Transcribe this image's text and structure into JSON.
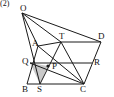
{
  "figure": {
    "problem_number": "(2)",
    "background_color": "#ffffff",
    "stroke_color": "#1a1a1a",
    "shade_color": "#c9c9c9",
    "width": 114,
    "height": 97,
    "points": {
      "O": {
        "label": "O",
        "x": 22,
        "y": 13,
        "label_x": 20,
        "label_y": 4
      },
      "A": {
        "label": "A",
        "x": 38,
        "y": 46,
        "label_x": 32,
        "label_y": 39
      },
      "T": {
        "label": "T",
        "x": 61,
        "y": 42,
        "label_x": 59,
        "label_y": 32
      },
      "D": {
        "label": "D",
        "x": 101,
        "y": 42,
        "label_x": 98,
        "label_y": 32
      },
      "Q": {
        "label": "Q",
        "x": 30,
        "y": 63,
        "label_x": 22,
        "label_y": 57
      },
      "P": {
        "label": "P",
        "x": 48,
        "y": 66,
        "label_x": 52,
        "label_y": 62
      },
      "R": {
        "label": "R",
        "x": 92,
        "y": 63,
        "label_x": 94,
        "label_y": 58
      },
      "B": {
        "label": "B",
        "x": 27,
        "y": 84,
        "label_x": 22,
        "label_y": 85
      },
      "S": {
        "label": "S",
        "x": 40,
        "y": 84,
        "label_x": 37,
        "label_y": 85
      },
      "C": {
        "label": "C",
        "x": 84,
        "y": 84,
        "label_x": 80,
        "label_y": 85
      }
    },
    "segments": [
      {
        "name": "segment-O-A",
        "from": "O",
        "to": "A"
      },
      {
        "name": "segment-O-T",
        "from": "O",
        "to": "T"
      },
      {
        "name": "segment-O-D",
        "from": "O",
        "to": "D"
      },
      {
        "name": "segment-O-S",
        "from": "O",
        "to": "S"
      },
      {
        "name": "segment-A-T",
        "from": "A",
        "to": "T"
      },
      {
        "name": "segment-T-D",
        "from": "T",
        "to": "D"
      },
      {
        "name": "segment-A-B",
        "from": "A",
        "to": "B"
      },
      {
        "name": "segment-D-C",
        "from": "D",
        "to": "C"
      },
      {
        "name": "segment-B-S",
        "from": "B",
        "to": "S"
      },
      {
        "name": "segment-S-C",
        "from": "S",
        "to": "C"
      },
      {
        "name": "segment-Q-R",
        "from": "Q",
        "to": "R"
      },
      {
        "name": "segment-A-C",
        "from": "A",
        "to": "C"
      },
      {
        "name": "segment-T-S",
        "from": "T",
        "to": "S"
      },
      {
        "name": "segment-T-C",
        "from": "T",
        "to": "C"
      },
      {
        "name": "segment-Q-C",
        "from": "Q",
        "to": "C"
      }
    ],
    "shaded_region": {
      "name": "shaded-triangle-QSP",
      "vertices": [
        "Q",
        "P",
        "S"
      ]
    },
    "marked_points": [
      "P"
    ]
  }
}
